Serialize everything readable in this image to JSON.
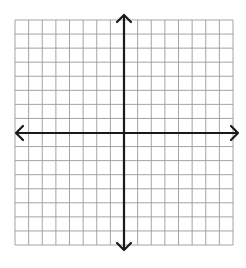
{
  "diagram": {
    "type": "coordinate-plane",
    "grid": {
      "columns": 16,
      "rows": 16,
      "left": 15,
      "top": 20,
      "right": 233,
      "bottom": 245,
      "line_color": "#9a9a9a"
    },
    "axes": {
      "origin_x": 124,
      "origin_y": 133,
      "x_axis": {
        "from": 16,
        "to": 238,
        "arrows": "both"
      },
      "y_axis": {
        "from": 15,
        "to": 250,
        "arrows": "both"
      },
      "color": "#1a1a1a"
    },
    "labels": []
  }
}
